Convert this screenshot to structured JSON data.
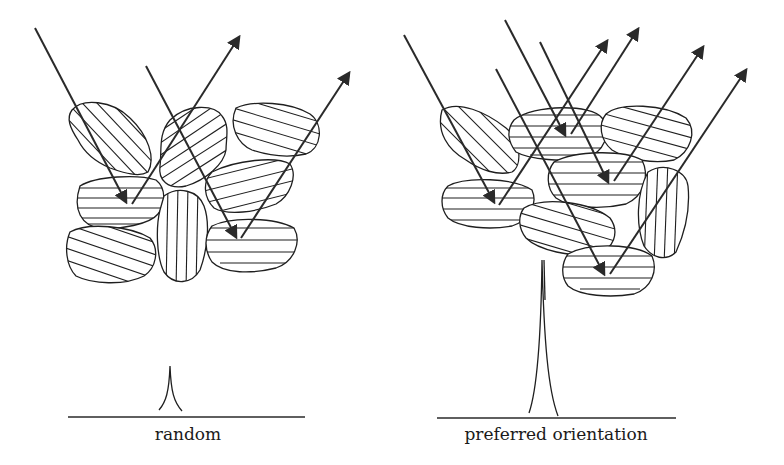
{
  "figure": {
    "panels": [
      {
        "id": "random",
        "caption": "random",
        "grain_count": 8,
        "incident_rays": 2,
        "diffracted_rays": 2,
        "peak_height": "small"
      },
      {
        "id": "preferred",
        "caption": "preferred orientation",
        "grain_count": 8,
        "incident_rays": 4,
        "diffracted_rays": 4,
        "peak_height": "large"
      }
    ],
    "icons": {
      "grain": "hatched-crystal-grain",
      "incident": "incident-ray-arrow",
      "diffracted": "diffracted-ray-arrow",
      "peak": "diffraction-peak"
    },
    "colors": {
      "stroke": "#1f1f1f",
      "background": "#ffffff"
    }
  }
}
